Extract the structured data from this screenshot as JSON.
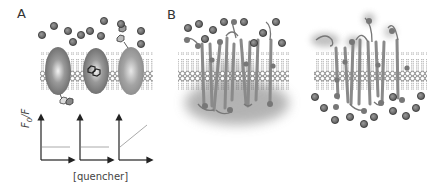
{
  "figure": {
    "panels": [
      {
        "label": "A",
        "description": "Membrane with three embedded proteins and soluble quenchers; fluorescence quenching plots"
      },
      {
        "label": "B",
        "description": "Transmembrane helical protein bundles in lipid bilayer, quenchers on top side (left) and bottom side (right)"
      }
    ],
    "plots": {
      "ylabel_main": "F",
      "ylabel_sub": "0",
      "ylabel_suffix": "/F",
      "xlabel": "[quencher]",
      "count": 3,
      "lines": [
        "flat",
        "flat",
        "rising"
      ]
    },
    "colors": {
      "quencher_fill": "#6e6e6e",
      "quencher_stroke": "#333333",
      "protein": "#8a8a8a",
      "lipid_head": "#ffffff",
      "lipid_stroke": "#444444",
      "helix": "#9a9a9a",
      "shadow": "#9e9e9e",
      "plot_axis": "#222222",
      "plot_line": "#aaaaaa"
    }
  }
}
